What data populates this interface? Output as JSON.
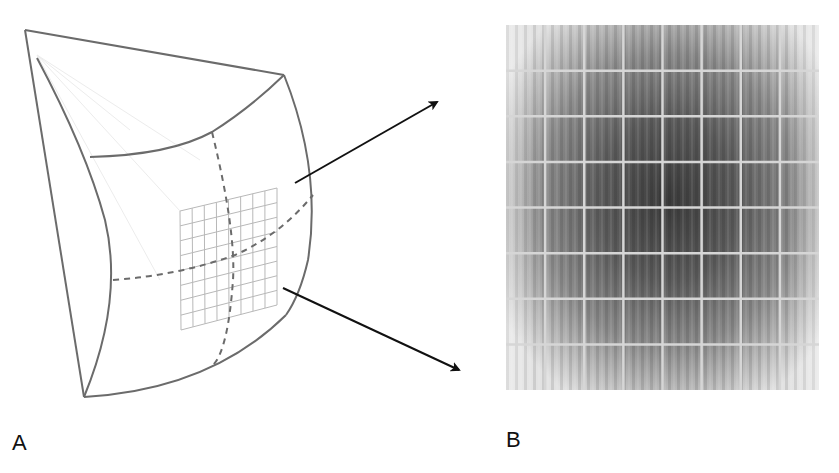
{
  "figure": {
    "panels": [
      {
        "id": "A",
        "label": "A",
        "description": "Curved detector surface (spherical segment) with an inset flat 8x8 tile grid and dashed meridian lines",
        "grid": {
          "rows": 8,
          "cols": 8
        },
        "colors": {
          "outline": "#6b6b6b",
          "dashed": "#6b6b6b",
          "grid": "#b8b8b8",
          "faint_rays": "#ececec"
        }
      },
      {
        "id": "B",
        "label": "B",
        "description": "Grayscale flat-field image of 8x8 tiled detector, darkest at center, fading to edges",
        "grid": {
          "rows": 8,
          "cols": 8
        },
        "colors": {
          "center": "#3c3c3c",
          "edge": "#e2e2e2",
          "gridline": "#d6d6d6"
        }
      }
    ],
    "arrows": [
      {
        "name": "upper-arrow",
        "from": [
          295,
          183
        ],
        "to": [
          441,
          100
        ]
      },
      {
        "name": "lower-arrow",
        "from": [
          283,
          288
        ],
        "to": [
          463,
          372
        ]
      }
    ],
    "arrow_color": "#111111"
  }
}
